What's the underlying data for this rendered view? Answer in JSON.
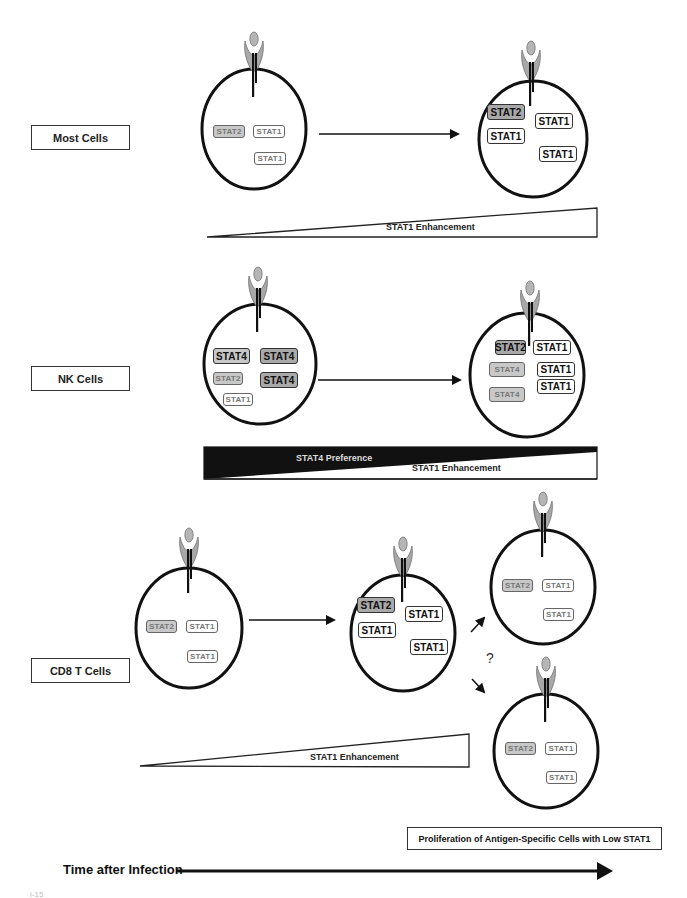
{
  "figure": {
    "rows": [
      {
        "id": "most-cells",
        "label": "Most Cells",
        "wedges": [
          {
            "label": "STAT1 Enhancement",
            "direction": "increasing",
            "fill": "#ffffff"
          }
        ],
        "cells": [
          {
            "stage": "early",
            "stats": [
              {
                "label": "STAT2",
                "style": "small gray"
              },
              {
                "label": "STAT1",
                "style": "small white"
              },
              {
                "label": "STAT1",
                "style": "small white"
              }
            ]
          },
          {
            "stage": "late",
            "stats": [
              {
                "label": "STAT2",
                "style": "big darkgray"
              },
              {
                "label": "STAT1",
                "style": "big white"
              },
              {
                "label": "STAT1",
                "style": "big white"
              },
              {
                "label": "STAT1",
                "style": "big white"
              }
            ]
          }
        ]
      },
      {
        "id": "nk-cells",
        "label": "NK Cells",
        "wedges": [
          {
            "label": "STAT4 Preference",
            "direction": "decreasing",
            "fill": "#111111"
          },
          {
            "label": "STAT1 Enhancement",
            "direction": "increasing",
            "fill": "#ffffff"
          }
        ],
        "cells": [
          {
            "stage": "early",
            "stats": [
              {
                "label": "STAT4",
                "style": "big gray"
              },
              {
                "label": "STAT4",
                "style": "big darkgray"
              },
              {
                "label": "STAT2",
                "style": "small gray"
              },
              {
                "label": "STAT4",
                "style": "big darkgray"
              },
              {
                "label": "STAT1",
                "style": "small white"
              }
            ]
          },
          {
            "stage": "late",
            "stats": [
              {
                "label": "STAT2",
                "style": "big darkgray"
              },
              {
                "label": "STAT1",
                "style": "big white"
              },
              {
                "label": "STAT4",
                "style": "small gray"
              },
              {
                "label": "STAT1",
                "style": "big white"
              },
              {
                "label": "STAT1",
                "style": "big white"
              },
              {
                "label": "STAT4",
                "style": "small gray"
              }
            ]
          }
        ]
      },
      {
        "id": "cd8-t-cells",
        "label": "CD8 T Cells",
        "wedges": [
          {
            "label": "STAT1 Enhancement",
            "direction": "increasing",
            "fill": "#ffffff"
          }
        ],
        "cells": [
          {
            "stage": "early",
            "stats": [
              {
                "label": "STAT2",
                "style": "small gray"
              },
              {
                "label": "STAT1",
                "style": "small white"
              },
              {
                "label": "STAT1",
                "style": "small white"
              }
            ]
          },
          {
            "stage": "peak",
            "stats": [
              {
                "label": "STAT2",
                "style": "big darkgray"
              },
              {
                "label": "STAT1",
                "style": "big white"
              },
              {
                "label": "STAT1",
                "style": "big white"
              },
              {
                "label": "STAT1",
                "style": "big white"
              }
            ]
          },
          {
            "stage": "outcome-upper",
            "stats": [
              {
                "label": "STAT2",
                "style": "small gray"
              },
              {
                "label": "STAT1",
                "style": "small white"
              },
              {
                "label": "STAT1",
                "style": "small white"
              }
            ]
          },
          {
            "stage": "outcome-lower",
            "stats": [
              {
                "label": "STAT2",
                "style": "small gray"
              },
              {
                "label": "STAT1",
                "style": "small white"
              },
              {
                "label": "STAT1",
                "style": "small white"
              }
            ]
          }
        ],
        "branch_symbol": "?",
        "note": "Proliferation of Antigen-Specific Cells with Low STAT1"
      }
    ],
    "time_axis": {
      "label": "Time after Infection"
    },
    "corner_fragment": "i-15"
  },
  "colors": {
    "outline": "#111111",
    "receptor_fill": "#a8a8a8",
    "ligand_fill": "#b5b5b5",
    "stat_light_gray": "#c8c8c8",
    "stat_dark_gray": "#a9a9a9",
    "wedge_dark": "#111111"
  }
}
